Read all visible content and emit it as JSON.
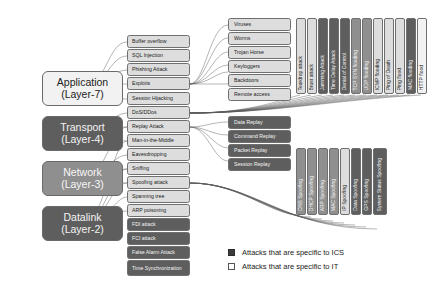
{
  "diagram": {
    "colors": {
      "it_fill": "#dddddd",
      "ics_fill": "#5e5e5e",
      "mid_fill": "#8f8f8f",
      "line": "#555555",
      "text_dark": "#222222",
      "text_light": "#f4f4f4"
    }
  },
  "layers": [
    {
      "name": "Application",
      "level": "(Layer-7)",
      "style": "it-light"
    },
    {
      "name": "Transport",
      "level": "(Layer-4)",
      "style": "ics"
    },
    {
      "name": "Network",
      "level": "(Layer-3)",
      "style": "mid"
    },
    {
      "name": "Datalink",
      "level": "(Layer-2)",
      "style": "ics"
    }
  ],
  "attacks": [
    {
      "label": "Buffer overflow",
      "style": "it"
    },
    {
      "label": "SQL Injection",
      "style": "it"
    },
    {
      "label": "Phishing Attack",
      "style": "it"
    },
    {
      "label": "Exploits",
      "style": "it"
    },
    {
      "label": "Session Hijacking",
      "style": "it"
    },
    {
      "label": "DoS/DDos",
      "style": "it"
    },
    {
      "label": "Replay Attack",
      "style": "it"
    },
    {
      "label": "Man-in-the-Middle",
      "style": "it"
    },
    {
      "label": "Eavesdropping",
      "style": "it"
    },
    {
      "label": "Sniffing",
      "style": "it"
    },
    {
      "label": "Spoofing attack",
      "style": "it"
    },
    {
      "label": "Spanning tree",
      "style": "it"
    },
    {
      "label": "ARP poisoning",
      "style": "it"
    },
    {
      "label": "FDI attack",
      "style": "ics"
    },
    {
      "label": "FCI attack",
      "style": "ics"
    },
    {
      "label": "False Alarm Attack",
      "style": "ics"
    },
    {
      "label": "Time Synchronization",
      "style": "ics"
    }
  ],
  "malware_group": [
    {
      "label": "Viruses",
      "style": "it"
    },
    {
      "label": "Worms",
      "style": "it"
    },
    {
      "label": "Trojan Horse",
      "style": "it"
    },
    {
      "label": "Keyloggers",
      "style": "it"
    },
    {
      "label": "Backdoors",
      "style": "it"
    },
    {
      "label": "Remote access",
      "style": "it"
    }
  ],
  "replay_group": [
    {
      "label": "Data Replay",
      "style": "ics"
    },
    {
      "label": "Command Replay",
      "style": "ics"
    },
    {
      "label": "Packet Replay",
      "style": "ics"
    },
    {
      "label": "Session Replay",
      "style": "ics"
    }
  ],
  "dos_group": [
    {
      "label": "Teardrop attack",
      "style": "it"
    },
    {
      "label": "Brust attack",
      "style": "it"
    },
    {
      "label": "Jamming Attack",
      "style": "ics"
    },
    {
      "label": "Time Delay Attack",
      "style": "ics"
    },
    {
      "label": "Denial of Control",
      "style": "ics"
    },
    {
      "label": "TCP SYN flooding",
      "style": "mid"
    },
    {
      "label": "UDP flooding",
      "style": "mid"
    },
    {
      "label": "ICMP flooding",
      "style": "it"
    },
    {
      "label": "Ping of Death",
      "style": "it"
    },
    {
      "label": "Ping flood",
      "style": "it"
    },
    {
      "label": "MAC flooding",
      "style": "ics"
    },
    {
      "label": "HTTP flood",
      "style": "it-light"
    }
  ],
  "spoofing_group": [
    {
      "label": "DNS Spoofing",
      "style": "mid"
    },
    {
      "label": "DHCP Spoofing",
      "style": "mid"
    },
    {
      "label": "ARP Spoofing",
      "style": "mid"
    },
    {
      "label": "MAC Spoofing",
      "style": "mid"
    },
    {
      "label": "IP Spoofing",
      "style": "it"
    },
    {
      "label": "Data Spoofing",
      "style": "ics"
    },
    {
      "label": "GPS Spoofing",
      "style": "ics"
    },
    {
      "label": "System Status Spoofing",
      "style": "ics"
    }
  ],
  "legend": [
    {
      "label": "Attacks that are specific to ICS",
      "swatch": "dark"
    },
    {
      "label": "Attacks that are specific to IT",
      "swatch": "light"
    }
  ]
}
